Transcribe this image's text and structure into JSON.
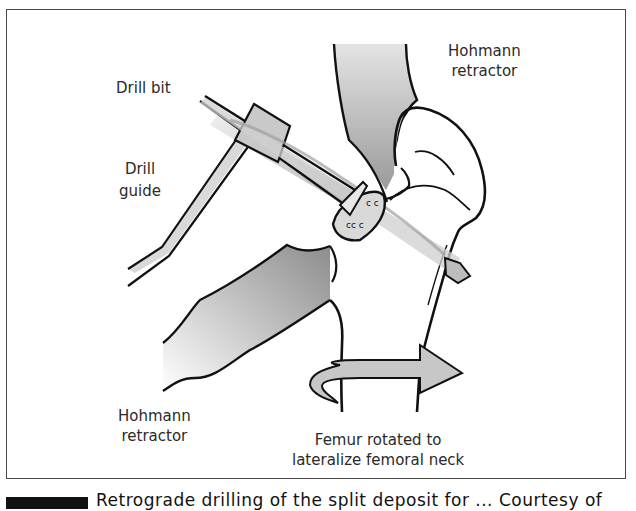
{
  "figure": {
    "labels": {
      "drill_bit": "Drill bit",
      "drill_guide": "Drill guide",
      "hohmann_top": "Hohmann\nretractor",
      "hohmann_top_l1": "Hohmann",
      "hohmann_top_l2": "retractor",
      "hohmann_bottom_l1": "Hohmann",
      "hohmann_bottom_l2": "retractor",
      "femur_l1": "Femur rotated to",
      "femur_l2": "lateralize femoral neck"
    },
    "colors": {
      "outline": "#111111",
      "instrument_fill": "#d4d4d4",
      "retractor_fill": "#a8a8a8",
      "bone_fill": "#ffffff",
      "lesion_fill": "#d8d8d8",
      "border": "#4a4a4a"
    }
  },
  "caption": {
    "text": "Retrograde drilling of the split deposit for ... Courtesy of"
  }
}
